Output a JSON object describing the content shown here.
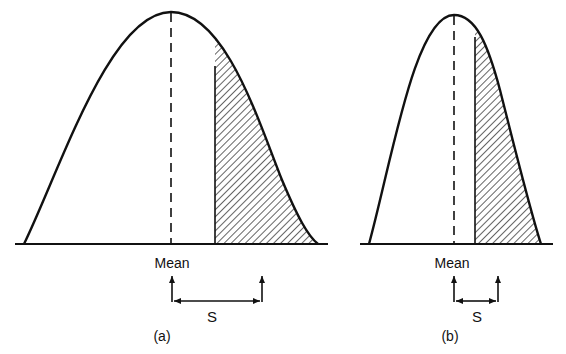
{
  "figure": {
    "colors": {
      "ink": "#111111",
      "background": "#ffffff"
    },
    "panels": [
      {
        "id": "a",
        "caption": "(a)",
        "mean_label": "Mean",
        "s_label": "S",
        "shape": "wide bell curve",
        "shaded_region": "tail beyond mean + S (hatched)"
      },
      {
        "id": "b",
        "caption": "(b)",
        "mean_label": "Mean",
        "s_label": "S",
        "shape": "narrow curve",
        "shaded_region": "tail beyond mean + S (hatched)"
      }
    ]
  }
}
